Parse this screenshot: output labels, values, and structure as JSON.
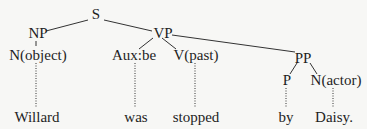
{
  "tree": {
    "nodes": {
      "S": "S",
      "NP": "NP",
      "VP": "VP",
      "PP": "PP",
      "N_object": "N(object)",
      "Aux": "Aux:be",
      "V": "V(past)",
      "P": "P",
      "N_actor": "N(actor)"
    },
    "leaves": {
      "willard": "Willard",
      "was": "was",
      "stopped": "stopped",
      "by": "by",
      "daisy": "Daisy."
    }
  }
}
